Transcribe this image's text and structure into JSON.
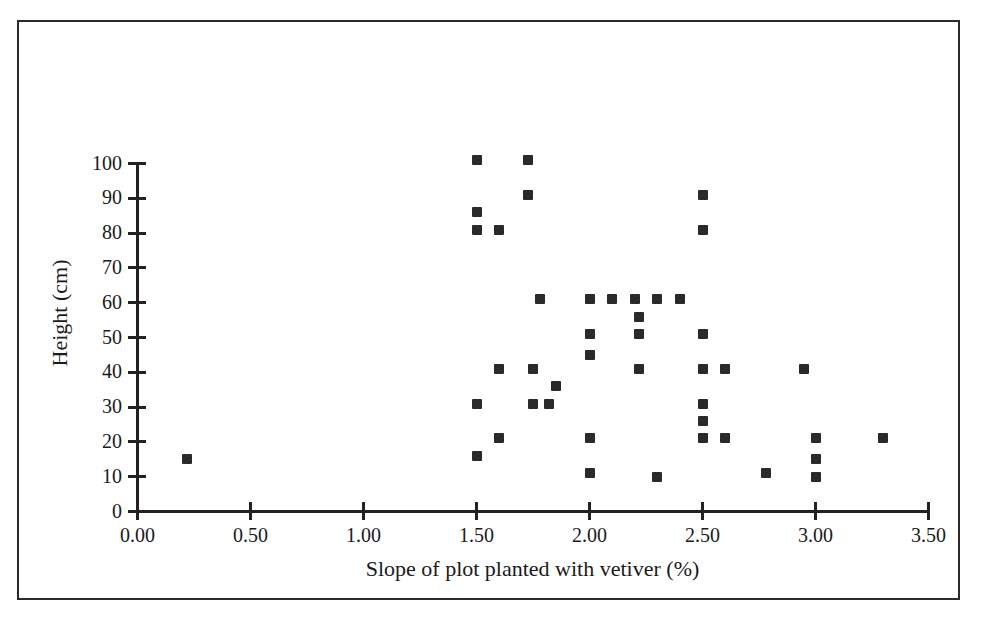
{
  "chart_data": {
    "type": "scatter",
    "title": "",
    "xlabel": "Slope of plot planted with vetiver (%)",
    "ylabel": "Height (cm)",
    "xlim": [
      0.0,
      3.5
    ],
    "ylim": [
      0,
      100
    ],
    "xticks": [
      "0.00",
      "0.50",
      "1.00",
      "1.50",
      "2.00",
      "2.50",
      "3.00",
      "3.50"
    ],
    "xtick_values": [
      0.0,
      0.5,
      1.0,
      1.5,
      2.0,
      2.5,
      3.0,
      3.5
    ],
    "yticks": [
      "0",
      "10",
      "20",
      "30",
      "40",
      "50",
      "60",
      "70",
      "80",
      "90",
      "100"
    ],
    "ytick_values": [
      0,
      10,
      20,
      30,
      40,
      50,
      60,
      70,
      80,
      90,
      100
    ],
    "grid": false,
    "legend": false,
    "marker": "filled-square",
    "marker_color": "#2a2a2a",
    "points": [
      {
        "x": 0.22,
        "y": 15
      },
      {
        "x": 1.5,
        "y": 101
      },
      {
        "x": 1.73,
        "y": 101
      },
      {
        "x": 1.73,
        "y": 91
      },
      {
        "x": 1.5,
        "y": 86
      },
      {
        "x": 1.5,
        "y": 81
      },
      {
        "x": 1.6,
        "y": 81
      },
      {
        "x": 2.5,
        "y": 91
      },
      {
        "x": 2.5,
        "y": 81
      },
      {
        "x": 1.78,
        "y": 61
      },
      {
        "x": 2.0,
        "y": 61
      },
      {
        "x": 2.1,
        "y": 61
      },
      {
        "x": 2.2,
        "y": 61
      },
      {
        "x": 2.3,
        "y": 61
      },
      {
        "x": 2.4,
        "y": 61
      },
      {
        "x": 2.22,
        "y": 56
      },
      {
        "x": 2.0,
        "y": 51
      },
      {
        "x": 2.22,
        "y": 51
      },
      {
        "x": 2.5,
        "y": 51
      },
      {
        "x": 2.0,
        "y": 45
      },
      {
        "x": 1.6,
        "y": 41
      },
      {
        "x": 1.75,
        "y": 41
      },
      {
        "x": 2.22,
        "y": 41
      },
      {
        "x": 2.5,
        "y": 41
      },
      {
        "x": 2.6,
        "y": 41
      },
      {
        "x": 2.95,
        "y": 41
      },
      {
        "x": 1.85,
        "y": 36
      },
      {
        "x": 1.5,
        "y": 31
      },
      {
        "x": 1.75,
        "y": 31
      },
      {
        "x": 1.82,
        "y": 31
      },
      {
        "x": 2.5,
        "y": 31
      },
      {
        "x": 2.5,
        "y": 26
      },
      {
        "x": 1.6,
        "y": 21
      },
      {
        "x": 2.0,
        "y": 21
      },
      {
        "x": 2.5,
        "y": 21
      },
      {
        "x": 2.6,
        "y": 21
      },
      {
        "x": 3.0,
        "y": 21
      },
      {
        "x": 3.3,
        "y": 21
      },
      {
        "x": 1.5,
        "y": 16
      },
      {
        "x": 3.0,
        "y": 15
      },
      {
        "x": 2.0,
        "y": 11
      },
      {
        "x": 2.78,
        "y": 11
      },
      {
        "x": 2.3,
        "y": 10
      },
      {
        "x": 3.0,
        "y": 10
      }
    ]
  },
  "figure": {
    "border_color": "#2b2b2b",
    "background": "#ffffff"
  }
}
